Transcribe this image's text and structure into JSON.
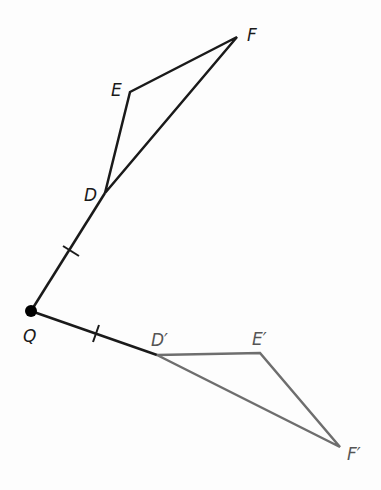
{
  "diagram": {
    "colors": {
      "original": "#1a1a1a",
      "image": "#6e6e6e",
      "center": "#000000"
    },
    "center": {
      "label": "Q",
      "x": 31,
      "y": 311
    },
    "original_triangle": {
      "D": {
        "label": "D",
        "x": 105,
        "y": 193
      },
      "E": {
        "label": "E",
        "x": 130,
        "y": 92
      },
      "F": {
        "label": "F",
        "x": 237,
        "y": 37
      }
    },
    "image_triangle": {
      "D": {
        "label": "D′",
        "x": 157,
        "y": 355
      },
      "E": {
        "label": "E′",
        "x": 260,
        "y": 353
      },
      "F": {
        "label": "F′",
        "x": 340,
        "y": 447
      }
    },
    "segments": [
      {
        "from": "Q",
        "to": "D",
        "tick_marks": 1
      },
      {
        "from": "Q",
        "to": "D′",
        "tick_marks": 1
      }
    ]
  }
}
